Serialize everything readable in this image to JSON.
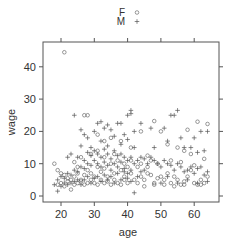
{
  "chart_data": {
    "type": "scatter",
    "title": "",
    "xlabel": "age",
    "ylabel": "wage",
    "xlim": [
      15.5,
      67
    ],
    "ylim": [
      -1.5,
      48.5
    ],
    "x_ticks": [
      20,
      30,
      40,
      50,
      60
    ],
    "y_ticks": [
      0,
      10,
      20,
      30,
      40
    ],
    "grid": false,
    "legend_position": "top",
    "legend": [
      {
        "label": "F",
        "marker": "circle"
      },
      {
        "label": "M",
        "marker": "plus"
      }
    ],
    "series": [
      {
        "name": "F",
        "marker": "circle",
        "points": [
          [
            21,
            44.5
          ],
          [
            27,
            25
          ],
          [
            28,
            25
          ],
          [
            48,
            23.2
          ],
          [
            61,
            23
          ],
          [
            64,
            22.3
          ],
          [
            58,
            20.5
          ],
          [
            50,
            20
          ],
          [
            35,
            18
          ],
          [
            38,
            17
          ],
          [
            44,
            20
          ],
          [
            52,
            16
          ],
          [
            55,
            15
          ],
          [
            57,
            14
          ],
          [
            59,
            13
          ],
          [
            46,
            12.5
          ],
          [
            47,
            11
          ],
          [
            49,
            10
          ],
          [
            53,
            11
          ],
          [
            56,
            10.5
          ],
          [
            60,
            9.5
          ],
          [
            63,
            11.5
          ],
          [
            18,
            10
          ],
          [
            19,
            8
          ],
          [
            20,
            7
          ],
          [
            21,
            6.5
          ],
          [
            22,
            5.5
          ],
          [
            23,
            2
          ],
          [
            24,
            6
          ],
          [
            25,
            7
          ],
          [
            26,
            5
          ],
          [
            27,
            6.5
          ],
          [
            28,
            8
          ],
          [
            29,
            7
          ],
          [
            30,
            6
          ],
          [
            31,
            9
          ],
          [
            32,
            7.5
          ],
          [
            33,
            8.5
          ],
          [
            34,
            6
          ],
          [
            35,
            10
          ],
          [
            36,
            7
          ],
          [
            37,
            11
          ],
          [
            38,
            8
          ],
          [
            39,
            6
          ],
          [
            40,
            9
          ],
          [
            41,
            7
          ],
          [
            42,
            5
          ],
          [
            43,
            4
          ],
          [
            44,
            6
          ],
          [
            45,
            5
          ],
          [
            46,
            7
          ],
          [
            47,
            6.5
          ],
          [
            48,
            4
          ],
          [
            49,
            5.5
          ],
          [
            50,
            6
          ],
          [
            51,
            5
          ],
          [
            52,
            7
          ],
          [
            53,
            4
          ],
          [
            54,
            6
          ],
          [
            55,
            5
          ],
          [
            56,
            3.5
          ],
          [
            57,
            4.5
          ],
          [
            58,
            6
          ],
          [
            59,
            8
          ],
          [
            60,
            4
          ],
          [
            61,
            3.5
          ],
          [
            62,
            5
          ],
          [
            63,
            4
          ],
          [
            64,
            6
          ],
          [
            19,
            3.5
          ],
          [
            20,
            4
          ],
          [
            21,
            3
          ],
          [
            22,
            4.5
          ],
          [
            23,
            5
          ],
          [
            24,
            3.5
          ],
          [
            25,
            4
          ],
          [
            26,
            4.5
          ],
          [
            27,
            3.5
          ],
          [
            28,
            4
          ],
          [
            29,
            5
          ],
          [
            30,
            4
          ],
          [
            31,
            3.5
          ],
          [
            32,
            5
          ],
          [
            33,
            4
          ],
          [
            34,
            4.5
          ],
          [
            35,
            3.5
          ],
          [
            36,
            5
          ],
          [
            37,
            4
          ],
          [
            38,
            3.5
          ],
          [
            39,
            5
          ],
          [
            40,
            4
          ],
          [
            45,
            3
          ],
          [
            48,
            3.5
          ],
          [
            51,
            3.5
          ],
          [
            54,
            3
          ],
          [
            57,
            3.5
          ],
          [
            62,
            3.5
          ],
          [
            26,
            12
          ],
          [
            29,
            13
          ],
          [
            31,
            14
          ],
          [
            33,
            12
          ],
          [
            36,
            13
          ],
          [
            39,
            10
          ],
          [
            41,
            11
          ],
          [
            43,
            9
          ],
          [
            44,
            10
          ],
          [
            46,
            9
          ],
          [
            31,
            19
          ],
          [
            33,
            17
          ],
          [
            41,
            15
          ],
          [
            25,
            9
          ],
          [
            24,
            10.5
          ]
        ]
      },
      {
        "name": "M",
        "marker": "plus",
        "points": [
          [
            24,
            25
          ],
          [
            31,
            22.5
          ],
          [
            32,
            23
          ],
          [
            34,
            22
          ],
          [
            37,
            22.5
          ],
          [
            38,
            22.5
          ],
          [
            40,
            25
          ],
          [
            41,
            25.5
          ],
          [
            41,
            26.5
          ],
          [
            44,
            22.5
          ],
          [
            53,
            25
          ],
          [
            54,
            25
          ],
          [
            55,
            26.5
          ],
          [
            47,
            21
          ],
          [
            26,
            20.5
          ],
          [
            27,
            19
          ],
          [
            30,
            20
          ],
          [
            33,
            21
          ],
          [
            35,
            20.5
          ],
          [
            39,
            19
          ],
          [
            42,
            20
          ],
          [
            51,
            21
          ],
          [
            62,
            20
          ],
          [
            64,
            20
          ],
          [
            28,
            18
          ],
          [
            32,
            17
          ],
          [
            36,
            18.5
          ],
          [
            40,
            17.5
          ],
          [
            29,
            15
          ],
          [
            34,
            15.5
          ],
          [
            38,
            16
          ],
          [
            42,
            15
          ],
          [
            48,
            15
          ],
          [
            52,
            17
          ],
          [
            56,
            18
          ],
          [
            60,
            18
          ],
          [
            57,
            15
          ],
          [
            59,
            15
          ],
          [
            61,
            13.5
          ],
          [
            63,
            14
          ],
          [
            22,
            12
          ],
          [
            23,
            13
          ],
          [
            25,
            12
          ],
          [
            26,
            15.5
          ],
          [
            27,
            11
          ],
          [
            28,
            13.5
          ],
          [
            29,
            12.5
          ],
          [
            30,
            14
          ],
          [
            31,
            13
          ],
          [
            32,
            12
          ],
          [
            33,
            14.5
          ],
          [
            34,
            13
          ],
          [
            35,
            11.5
          ],
          [
            36,
            14
          ],
          [
            37,
            12.5
          ],
          [
            38,
            13
          ],
          [
            39,
            12
          ],
          [
            40,
            11
          ],
          [
            41,
            12
          ],
          [
            42,
            10
          ],
          [
            43,
            11
          ],
          [
            44,
            12
          ],
          [
            45,
            11.5
          ],
          [
            46,
            10
          ],
          [
            47,
            12
          ],
          [
            48,
            11
          ],
          [
            49,
            10
          ],
          [
            50,
            9
          ],
          [
            51,
            11
          ],
          [
            52,
            10
          ],
          [
            53,
            9.5
          ],
          [
            54,
            8
          ],
          [
            55,
            10
          ],
          [
            56,
            9
          ],
          [
            57,
            7.5
          ],
          [
            58,
            8
          ],
          [
            59,
            9
          ],
          [
            60,
            7
          ],
          [
            61,
            8.5
          ],
          [
            62,
            9
          ],
          [
            63,
            6.5
          ],
          [
            64,
            7.5
          ],
          [
            18,
            3.5
          ],
          [
            19,
            5
          ],
          [
            20,
            6
          ],
          [
            21,
            5.5
          ],
          [
            22,
            7
          ],
          [
            23,
            6.5
          ],
          [
            24,
            8
          ],
          [
            25,
            7.5
          ],
          [
            26,
            9
          ],
          [
            27,
            8.5
          ],
          [
            28,
            10
          ],
          [
            29,
            9.5
          ],
          [
            30,
            11
          ],
          [
            31,
            10
          ],
          [
            32,
            9
          ],
          [
            33,
            10.5
          ],
          [
            34,
            9.5
          ],
          [
            35,
            8
          ],
          [
            36,
            10
          ],
          [
            37,
            9
          ],
          [
            38,
            10.5
          ],
          [
            39,
            8.5
          ],
          [
            40,
            7
          ],
          [
            41,
            8
          ],
          [
            42,
            1
          ],
          [
            43,
            6
          ],
          [
            44,
            7.5
          ],
          [
            45,
            8
          ],
          [
            19,
            1.5
          ],
          [
            20,
            3
          ],
          [
            21,
            4
          ],
          [
            22,
            3.5
          ],
          [
            23,
            4
          ],
          [
            24,
            4.5
          ],
          [
            25,
            5
          ],
          [
            26,
            3.5
          ],
          [
            27,
            5
          ],
          [
            28,
            6
          ],
          [
            29,
            4
          ],
          [
            30,
            5.5
          ],
          [
            31,
            6
          ],
          [
            32,
            4.5
          ],
          [
            33,
            6.5
          ],
          [
            34,
            5
          ],
          [
            35,
            6
          ],
          [
            36,
            4
          ],
          [
            37,
            7
          ],
          [
            38,
            5
          ],
          [
            39,
            7.5
          ],
          [
            40,
            5.5
          ],
          [
            41,
            4.5
          ],
          [
            50,
            4
          ],
          [
            52,
            6
          ],
          [
            55,
            4
          ],
          [
            58,
            5
          ],
          [
            61,
            4
          ],
          [
            64,
            4.5
          ]
        ]
      }
    ]
  },
  "colors": {
    "frame": "#555555",
    "marker": "#555555",
    "text": "#333333"
  }
}
